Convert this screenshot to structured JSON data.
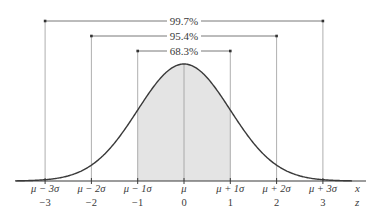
{
  "diagram": {
    "type": "normal-distribution",
    "colors": {
      "curve": "#3a3a3a",
      "shade": "#e4e4e4",
      "guides": "#9a9a9a",
      "text": "#3a3a3a",
      "axis": "#3a3a3a"
    },
    "brackets": [
      {
        "label": "99.7%",
        "from_z": -3,
        "to_z": 3
      },
      {
        "label": "95.4%",
        "from_z": -2,
        "to_z": 2
      },
      {
        "label": "68.3%",
        "from_z": -1,
        "to_z": 1
      }
    ],
    "shaded_region": {
      "from_z": -1,
      "to_z": 1
    },
    "ticks": [
      {
        "z": -3,
        "x_label": "μ − 3σ",
        "z_label": "−3"
      },
      {
        "z": -2,
        "x_label": "μ − 2σ",
        "z_label": "−2"
      },
      {
        "z": -1,
        "x_label": "μ − 1σ",
        "z_label": "−1"
      },
      {
        "z": 0,
        "x_label": "μ",
        "z_label": "0"
      },
      {
        "z": 1,
        "x_label": "μ + 1σ",
        "z_label": "1"
      },
      {
        "z": 2,
        "x_label": "μ + 2σ",
        "z_label": "2"
      },
      {
        "z": 3,
        "x_label": "μ + 3σ",
        "z_label": "3"
      }
    ],
    "axis_labels": {
      "x": "x",
      "z": "z"
    }
  }
}
